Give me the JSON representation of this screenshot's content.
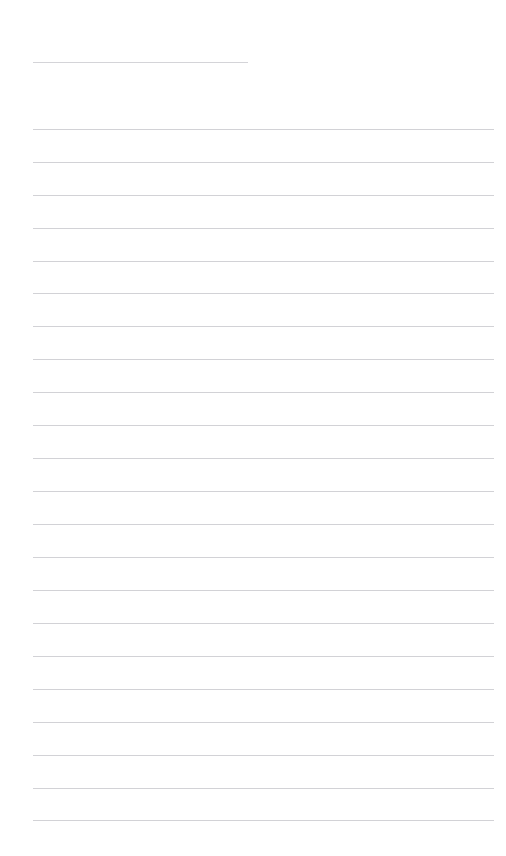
{
  "page": {
    "width": 506,
    "height": 856,
    "background_color": "#ffffff",
    "body_text": ""
  },
  "ruled_lines": {
    "line_color": "#d2d2d6",
    "line_thickness_px": 1,
    "left_margin_px": 33,
    "right_edge_px": 494,
    "line_spacing_px": 32.9,
    "header_rule": {
      "y": 62,
      "x_start": 33,
      "x_end": 248,
      "width": 215,
      "color": "#d4d4d8"
    },
    "body_rules": [
      {
        "index": 1,
        "y": 129
      },
      {
        "index": 2,
        "y": 162
      },
      {
        "index": 3,
        "y": 195
      },
      {
        "index": 4,
        "y": 228
      },
      {
        "index": 5,
        "y": 261
      },
      {
        "index": 6,
        "y": 293
      },
      {
        "index": 7,
        "y": 326
      },
      {
        "index": 8,
        "y": 359
      },
      {
        "index": 9,
        "y": 392
      },
      {
        "index": 10,
        "y": 425
      },
      {
        "index": 11,
        "y": 458
      },
      {
        "index": 12,
        "y": 491
      },
      {
        "index": 13,
        "y": 524
      },
      {
        "index": 14,
        "y": 557
      },
      {
        "index": 15,
        "y": 590
      },
      {
        "index": 16,
        "y": 623
      },
      {
        "index": 17,
        "y": 656
      },
      {
        "index": 18,
        "y": 689
      },
      {
        "index": 19,
        "y": 722
      },
      {
        "index": 20,
        "y": 755
      },
      {
        "index": 21,
        "y": 788
      },
      {
        "index": 22,
        "y": 820
      }
    ]
  }
}
